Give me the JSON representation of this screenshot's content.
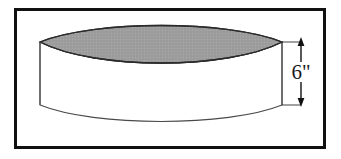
{
  "figure": {
    "frame": {
      "name": "figure-border",
      "stroke_color": "#111111",
      "fill_color": "#ffffff",
      "stroke_width": 3,
      "x": 15,
      "y": 9,
      "width": 309,
      "height": 138
    },
    "top_face": {
      "name": "shaded-lens-top-face",
      "fill_color": "#9d9d9d",
      "stroke_color": "#2b2b2b",
      "left_vertex": [
        40,
        42
      ],
      "right_vertex": [
        282,
        42
      ],
      "upper_peak_y": 20,
      "lower_dip_y": 70
    },
    "front_face": {
      "name": "front-face",
      "fill_color": "#ffffff",
      "stroke_color": "#4a4a4a",
      "left_edge_x": 40,
      "right_edge_x": 282,
      "top_y": 42,
      "bottom_y": 105,
      "bottom_curve_dip_y": 127
    },
    "dimension": {
      "name": "height-dimension",
      "label": "6\"",
      "value": 6,
      "unit": "inches",
      "arrow_x": 301,
      "arrow_top_y": 38,
      "arrow_bottom_y": 106,
      "color": "#111111"
    }
  }
}
